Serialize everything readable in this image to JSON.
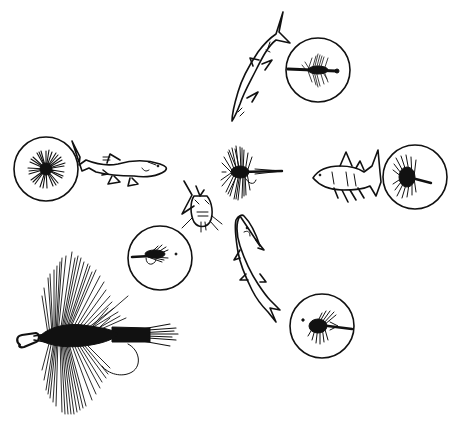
{
  "illustration": {
    "background": "#ffffff",
    "ink": "#111111",
    "center_fly": {
      "label": "center-fly",
      "cx": 250,
      "cy": 172
    },
    "circles": [
      {
        "name": "circle-top-right",
        "cx": 318,
        "cy": 70,
        "r": 32,
        "fly": "streamer-fly"
      },
      {
        "name": "circle-left",
        "cx": 46,
        "cy": 169,
        "r": 32,
        "fly": "palmer-fly-front-view"
      },
      {
        "name": "circle-right",
        "cx": 415,
        "cy": 177,
        "r": 32,
        "fly": "hackle-fly"
      },
      {
        "name": "circle-middle-left",
        "cx": 160,
        "cy": 258,
        "r": 32,
        "fly": "wet-fly"
      },
      {
        "name": "circle-bottom-right",
        "cx": 322,
        "cy": 326,
        "r": 32,
        "fly": "wet-fly-reversed"
      }
    ],
    "fish": [
      {
        "name": "fish-top",
        "orientation": "diving-down-left"
      },
      {
        "name": "fish-left",
        "orientation": "facing-right"
      },
      {
        "name": "fish-right",
        "orientation": "facing-left"
      },
      {
        "name": "fish-center-front",
        "orientation": "head-on"
      },
      {
        "name": "fish-lower",
        "orientation": "diving-down-right"
      }
    ],
    "large_fly": {
      "name": "large-hackle-fly",
      "x": 15,
      "y": 250,
      "w": 165,
      "h": 165
    }
  }
}
